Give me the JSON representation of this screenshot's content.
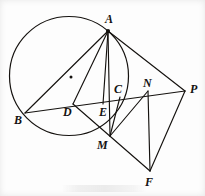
{
  "figure": {
    "type": "geometry-diagram",
    "width": 205,
    "height": 196,
    "stroke_color": "#15120f",
    "background_color": "#fdfdfd",
    "circle": {
      "label": "circumscribed-circle",
      "cx": 69,
      "cy": 76,
      "r": 59.5,
      "center_marked": true,
      "center_dot": {
        "cx": 71,
        "cy": 77,
        "r": 1.5
      }
    },
    "points": [
      {
        "name": "A",
        "label": "A",
        "x": 108,
        "y": 31,
        "label_x": 105,
        "label_y": 13,
        "dot": true
      },
      {
        "name": "B",
        "label": "B",
        "x": 25,
        "y": 113,
        "label_x": 14,
        "label_y": 114,
        "dot": false
      },
      {
        "name": "C",
        "label": "C",
        "x": 120,
        "y": 97,
        "label_x": 114,
        "label_y": 83,
        "dot": false
      },
      {
        "name": "D",
        "label": "D",
        "x": 73,
        "y": 104,
        "label_x": 63,
        "label_y": 106,
        "dot": false
      },
      {
        "name": "E",
        "label": "E",
        "x": 103,
        "y": 104,
        "label_x": 99,
        "label_y": 106,
        "dot": false
      },
      {
        "name": "F",
        "label": "F",
        "x": 150,
        "y": 171,
        "label_x": 145,
        "label_y": 176,
        "dot": false
      },
      {
        "name": "M",
        "label": "M",
        "x": 110,
        "y": 136,
        "label_x": 97,
        "label_y": 139,
        "dot": false
      },
      {
        "name": "N",
        "label": "N",
        "x": 148,
        "y": 91,
        "label_x": 143,
        "label_y": 77,
        "dot": false
      },
      {
        "name": "P",
        "label": "P",
        "x": 185,
        "y": 91,
        "label_x": 190,
        "label_y": 83,
        "dot": false
      }
    ],
    "segments": [
      {
        "name": "segment-A-B",
        "from": "A",
        "to": "B"
      },
      {
        "name": "segment-A-D",
        "from": "A",
        "to": "D"
      },
      {
        "name": "segment-A-E",
        "from": "A",
        "to": "E"
      },
      {
        "name": "segment-A-M",
        "from": "A",
        "to": "M"
      },
      {
        "name": "segment-A-P",
        "from": "A",
        "to": "P"
      },
      {
        "name": "segment-B-P",
        "from": "B",
        "to": "P"
      },
      {
        "name": "segment-D-F",
        "from": "D",
        "to": "F"
      },
      {
        "name": "segment-M-C",
        "from": "M",
        "to": "C"
      },
      {
        "name": "segment-M-N",
        "from": "M",
        "to": "N"
      },
      {
        "name": "segment-N-F",
        "from": "N",
        "to": "F"
      },
      {
        "name": "segment-P-F",
        "from": "P",
        "to": "F"
      }
    ]
  }
}
